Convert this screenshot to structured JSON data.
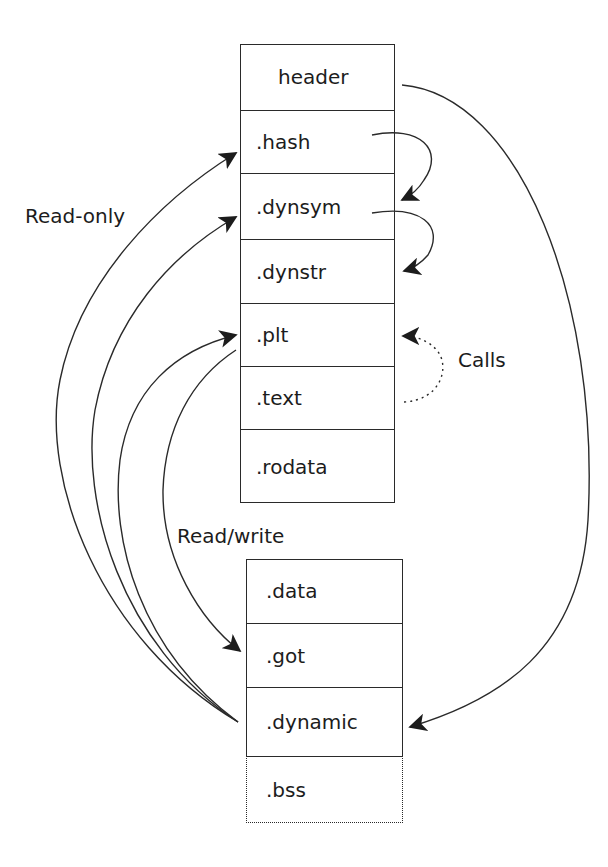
{
  "diagram": {
    "labels": {
      "read_only": "Read-only",
      "read_write": "Read/write",
      "calls": "Calls"
    },
    "readonly_segment": {
      "sections": [
        {
          "name": "header"
        },
        {
          "name": ".hash"
        },
        {
          "name": ".dynsym"
        },
        {
          "name": ".dynstr"
        },
        {
          "name": ".plt"
        },
        {
          "name": ".text"
        },
        {
          "name": ".rodata"
        }
      ]
    },
    "readwrite_segment": {
      "sections": [
        {
          "name": ".data"
        },
        {
          "name": ".got"
        },
        {
          "name": ".dynamic"
        },
        {
          "name": ".bss",
          "style": "dotted"
        }
      ]
    },
    "arrows": [
      {
        "from": ".hash",
        "to": ".dynsym",
        "style": "solid"
      },
      {
        "from": ".dynsym",
        "to": ".dynstr",
        "style": "solid"
      },
      {
        "from": ".text",
        "to": ".plt",
        "style": "dotted",
        "label": "Calls"
      },
      {
        "from": ".plt",
        "to": ".got",
        "style": "solid"
      },
      {
        "from": ".dynamic",
        "to": ".hash",
        "style": "solid"
      },
      {
        "from": ".dynamic",
        "to": ".dynsym",
        "style": "solid"
      },
      {
        "from": ".dynamic",
        "to": ".plt",
        "style": "solid"
      },
      {
        "from": "header",
        "to": ".dynamic",
        "style": "solid"
      }
    ]
  }
}
